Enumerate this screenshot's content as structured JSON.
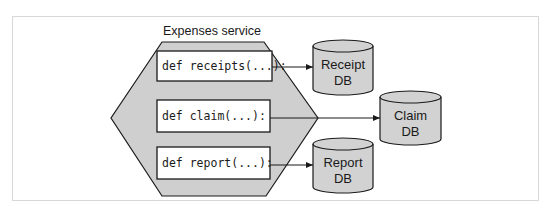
{
  "diagram": {
    "service": {
      "title": "Expenses service",
      "fill": "#cfcfcf",
      "functions": [
        {
          "label": "def receipts(...):",
          "target": "receipt-db"
        },
        {
          "label": "def claim(...):",
          "target": "claim-db"
        },
        {
          "label": "def report(...):",
          "target": "report-db"
        }
      ]
    },
    "databases": [
      {
        "id": "receipt-db",
        "line1": "Receipt",
        "line2": "DB"
      },
      {
        "id": "claim-db",
        "line1": "Claim",
        "line2": "DB"
      },
      {
        "id": "report-db",
        "line1": "Report",
        "line2": "DB"
      }
    ],
    "colors": {
      "shape_fill": "#cfcfcf",
      "stroke": "#1a1a1a",
      "box_fill": "#ffffff",
      "frame_border": "#d8d8d8"
    }
  }
}
